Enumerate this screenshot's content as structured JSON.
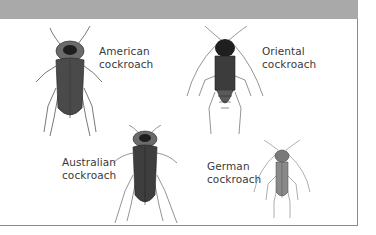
{
  "figure": {
    "header_band_color": "#a9a9a9",
    "specimens": [
      {
        "id": "american",
        "label_line1": "American",
        "label_line2": "cockroach"
      },
      {
        "id": "oriental",
        "label_line1": "Oriental",
        "label_line2": "cockroach"
      },
      {
        "id": "australian",
        "label_line1": "Australian",
        "label_line2": "cockroach"
      },
      {
        "id": "german",
        "label_line1": "German",
        "label_line2": "cockroach"
      }
    ]
  }
}
